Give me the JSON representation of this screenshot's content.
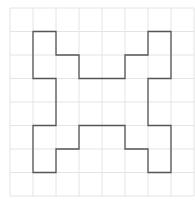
{
  "diagram": {
    "type": "grid-polygon",
    "grid": {
      "columns": 8,
      "rows": 8,
      "origin_px": [
        10,
        8
      ],
      "cell_w_px": 23,
      "cell_h_px": 23.5,
      "line_color": "#e4e4e4"
    },
    "shape": {
      "stroke_color": "#555555",
      "stroke_width": 1.3,
      "vertices_grid": [
        [
          1,
          1
        ],
        [
          2,
          1
        ],
        [
          2,
          2
        ],
        [
          3,
          2
        ],
        [
          3,
          3
        ],
        [
          5,
          3
        ],
        [
          5,
          2
        ],
        [
          6,
          2
        ],
        [
          6,
          1
        ],
        [
          7,
          1
        ],
        [
          7,
          3
        ],
        [
          6,
          3
        ],
        [
          6,
          5
        ],
        [
          7,
          5
        ],
        [
          7,
          7
        ],
        [
          6,
          7
        ],
        [
          6,
          6
        ],
        [
          5,
          6
        ],
        [
          5,
          5
        ],
        [
          3,
          5
        ],
        [
          3,
          6
        ],
        [
          2,
          6
        ],
        [
          2,
          7
        ],
        [
          1,
          7
        ],
        [
          1,
          5
        ],
        [
          2,
          5
        ],
        [
          2,
          3
        ],
        [
          1,
          3
        ]
      ]
    }
  }
}
